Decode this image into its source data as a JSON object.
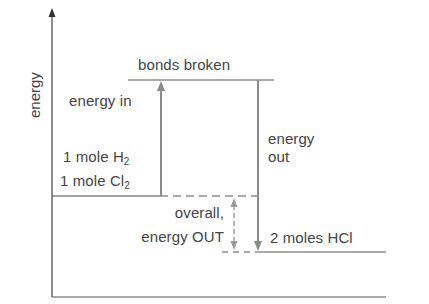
{
  "diagram": {
    "type": "energy-level-diagram",
    "y_axis_label": "energy",
    "levels": {
      "reactants": {
        "line1_text": "1 mole H",
        "line1_sub": "2",
        "line2_text": "1 mole Cl",
        "line2_sub": "2"
      },
      "bonds_broken": {
        "label": "bonds broken"
      },
      "products": {
        "label": "2 moles HCl"
      }
    },
    "arrows": {
      "energy_in": {
        "label": "energy in",
        "direction": "up"
      },
      "energy_out": {
        "line1": "energy",
        "line2": "out",
        "direction": "down"
      },
      "overall": {
        "line1": "overall,",
        "line2": "energy OUT",
        "style": "dashed",
        "direction": "both"
      }
    },
    "colors": {
      "axis": "#444444",
      "level_line": "#555555",
      "arrow": "#8a8a8a",
      "text": "#444444"
    }
  }
}
